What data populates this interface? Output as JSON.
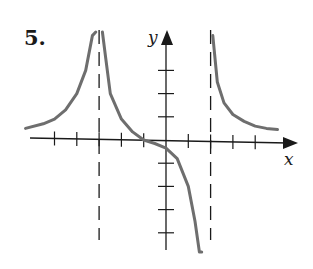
{
  "problem_number": "5.",
  "colors": {
    "axis": "#1a1a1a",
    "curve": "#6e6e6e",
    "asymptote": "#1a1a1a",
    "background": "#ffffff"
  },
  "chart_data": {
    "type": "line",
    "title": "",
    "xlabel": "x",
    "ylabel": "y",
    "xlim": [
      -6.5,
      6
    ],
    "ylim": [
      -6,
      4
    ],
    "grid": false,
    "x_ticks": [
      -5,
      -4,
      -3,
      -2,
      -1,
      1,
      2,
      3,
      4
    ],
    "y_ticks": [
      -4,
      -3,
      -2,
      -1,
      1,
      2,
      3
    ],
    "vertical_asymptotes": [
      -3,
      2
    ],
    "horizontal_asymptote": 0,
    "x_intercepts": [
      -1
    ],
    "y_intercept": -0.3,
    "series": [
      {
        "name": "left branch (x < -3)",
        "x": [
          -6.3,
          -5.5,
          -5,
          -4.5,
          -4,
          -3.6,
          -3.3,
          -3.15
        ],
        "y": [
          0.5,
          0.7,
          0.9,
          1.3,
          2.0,
          3.0,
          4.5,
          6.0
        ]
      },
      {
        "name": "middle branch (-3 < x < 2)",
        "x": [
          -2.85,
          -2.7,
          -2.5,
          -2,
          -1.5,
          -1,
          -0.5,
          0,
          0.5,
          1,
          1.3,
          1.5,
          1.6
        ],
        "y": [
          6.0,
          3.5,
          2.0,
          0.9,
          0.35,
          0.0,
          -0.15,
          -0.35,
          -0.8,
          -2.0,
          -3.5,
          -5.0,
          -6.5
        ]
      },
      {
        "name": "right branch (x > 2)",
        "x": [
          2.1,
          2.3,
          2.6,
          3,
          3.5,
          4,
          4.5,
          5
        ],
        "y": [
          4.5,
          2.5,
          1.6,
          1.1,
          0.8,
          0.6,
          0.5,
          0.45
        ]
      }
    ]
  }
}
